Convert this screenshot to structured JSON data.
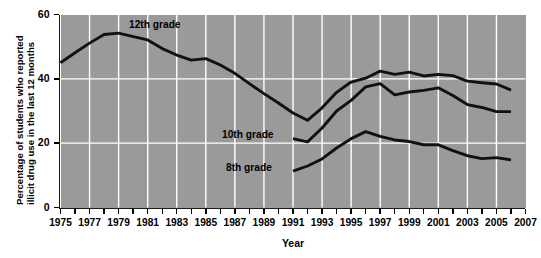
{
  "chart_data": {
    "type": "line",
    "title": "",
    "xlabel": "Year",
    "ylabel_line1": "Percentage of students who reported",
    "ylabel_line2": "illicit drug use in the last 12 months",
    "ylim": [
      0,
      60
    ],
    "xlim": [
      1975,
      2007
    ],
    "yticks": [
      0,
      20,
      40,
      60
    ],
    "ytick_labels": [
      "0",
      "20",
      "40",
      "60"
    ],
    "xticks": [
      1975,
      1976,
      1977,
      1978,
      1979,
      1980,
      1981,
      1982,
      1983,
      1984,
      1985,
      1986,
      1987,
      1988,
      1989,
      1990,
      1991,
      1992,
      1993,
      1994,
      1995,
      1996,
      1997,
      1998,
      1999,
      2000,
      2001,
      2002,
      2003,
      2004,
      2005,
      2006,
      2007
    ],
    "xtick_labels": [
      "1975",
      "1977",
      "1979",
      "1981",
      "1983",
      "1985",
      "1987",
      "1989",
      "1991",
      "1993",
      "1995",
      "1997",
      "1999",
      "2001",
      "2003",
      "2005",
      "2007"
    ],
    "xtick_label_years": [
      1975,
      1977,
      1979,
      1981,
      1983,
      1985,
      1987,
      1989,
      1991,
      1993,
      1995,
      1997,
      1999,
      2001,
      2003,
      2005,
      2007
    ],
    "gridlines_x": [
      1977,
      1979,
      1981,
      1983,
      1985,
      1987,
      1989,
      1991,
      1993,
      1995,
      1997,
      1999,
      2001,
      2003,
      2005
    ],
    "gridlines_y": [
      20,
      40
    ],
    "grid": true,
    "grid_color": "#ffffff",
    "plot_bg_color": "#9a9a9a",
    "line_color": "#111111",
    "legend_position": "inline-annotations",
    "series": [
      {
        "name": "12th grade",
        "label": "12th grade",
        "x": [
          1975,
          1976,
          1977,
          1978,
          1979,
          1980,
          1981,
          1982,
          1983,
          1984,
          1985,
          1986,
          1987,
          1988,
          1989,
          1990,
          1991,
          1992,
          1993,
          1994,
          1995,
          1996,
          1997,
          1998,
          1999,
          2000,
          2001,
          2002,
          2003,
          2004,
          2005,
          2006
        ],
        "values": [
          45.0,
          48.1,
          51.1,
          53.8,
          54.2,
          53.1,
          52.1,
          49.4,
          47.4,
          45.8,
          46.3,
          44.3,
          41.7,
          38.5,
          35.4,
          32.5,
          29.4,
          27.1,
          31.0,
          35.8,
          39.0,
          40.2,
          42.4,
          41.4,
          42.1,
          40.9,
          41.4,
          41.0,
          39.3,
          38.8,
          38.4,
          36.5
        ]
      },
      {
        "name": "10th grade",
        "label": "10th grade",
        "x": [
          1991,
          1992,
          1993,
          1994,
          1995,
          1996,
          1997,
          1998,
          1999,
          2000,
          2001,
          2002,
          2003,
          2004,
          2005,
          2006
        ],
        "values": [
          21.4,
          20.4,
          24.7,
          30.0,
          33.3,
          37.5,
          38.5,
          35.0,
          35.9,
          36.4,
          37.2,
          34.8,
          32.0,
          31.1,
          29.8,
          29.8
        ]
      },
      {
        "name": "8th grade",
        "label": "8th grade",
        "x": [
          1991,
          1992,
          1993,
          1994,
          1995,
          1996,
          1997,
          1998,
          1999,
          2000,
          2001,
          2002,
          2003,
          2004,
          2005,
          2006
        ],
        "values": [
          11.3,
          12.9,
          15.1,
          18.5,
          21.4,
          23.6,
          22.1,
          21.0,
          20.5,
          19.5,
          19.5,
          17.7,
          16.1,
          15.2,
          15.5,
          14.8
        ]
      }
    ],
    "annotations": [
      {
        "text": "12th grade",
        "x_px": 129,
        "y_px": 19
      },
      {
        "text": "10th grade",
        "x_px": 222,
        "y_px": 129
      },
      {
        "text": "8th grade",
        "x_px": 226,
        "y_px": 162
      }
    ]
  }
}
